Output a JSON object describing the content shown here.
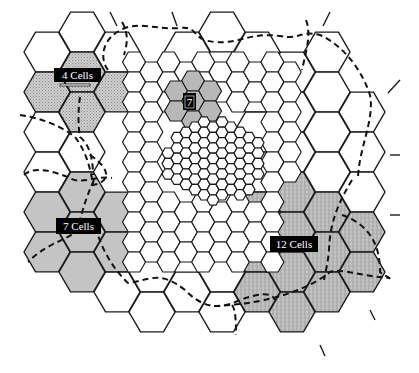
{
  "diagram": {
    "type": "hexagonal-cell-cluster-map",
    "colors": {
      "line": "#1a1a1a",
      "cell_fill": "#ffffff",
      "shade_4": "#bdbdbd",
      "shade_7_small": "#b8b8b8",
      "shade_7": "#c4c4c4",
      "shade_12": "#a8a8a8",
      "label_bg": "#000000",
      "label_fg": "#ffffff",
      "boundary": "#111111"
    },
    "labels": [
      {
        "id": "cluster-4",
        "text": "4 Cells",
        "x": 54,
        "y": 74
      },
      {
        "id": "cluster-7-small",
        "text": "7",
        "x": 183,
        "y": 94
      },
      {
        "id": "cluster-7",
        "text": "7 Cells",
        "x": 56,
        "y": 220
      },
      {
        "id": "cluster-12",
        "text": "12 Cells",
        "x": 270,
        "y": 238
      }
    ],
    "clusters": [
      {
        "name": "4 Cells",
        "cell_count": 4
      },
      {
        "name": "7",
        "cell_count": 7
      },
      {
        "name": "7 Cells",
        "cell_count": 7
      },
      {
        "name": "12 Cells",
        "cell_count": 12
      }
    ]
  }
}
